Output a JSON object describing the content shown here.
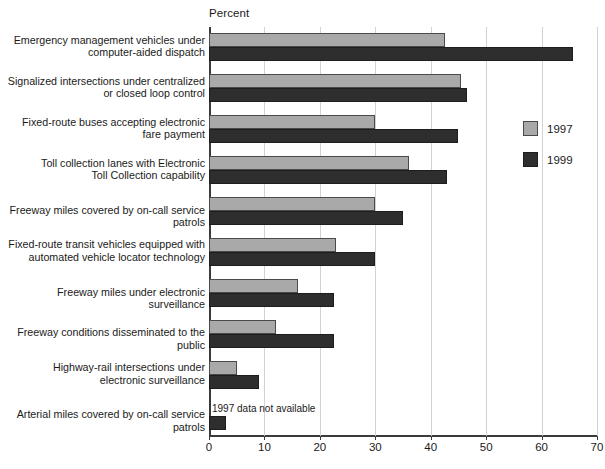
{
  "chart_data": {
    "type": "bar",
    "orientation": "horizontal",
    "title": "",
    "xlabel": "Percent",
    "ylabel": "",
    "xlim": [
      0,
      70
    ],
    "xticks": [
      0,
      10,
      20,
      30,
      40,
      50,
      60,
      70
    ],
    "grid": true,
    "legend_position": "right",
    "categories": [
      "Emergency management vehicles under\ncomputer-aided dispatch",
      "Signalized intersections under centralized\nor closed loop control",
      "Fixed-route buses accepting electronic\nfare payment",
      "Toll collection lanes with Electronic\nToll Collection capability",
      "Freeway miles covered by on-call service patrols",
      "Fixed-route transit vehicles equipped with\nautomated vehicle locator technology",
      "Freeway miles under electronic surveillance",
      "Freeway conditions disseminated to the public",
      "Highway-rail intersections under\nelectronic surveillance",
      "Arterial miles covered by on-call service patrols"
    ],
    "series": [
      {
        "name": "1997",
        "color": "#a9a9a9",
        "values": [
          42.5,
          45.5,
          30,
          36,
          30,
          23,
          16,
          12,
          5,
          null
        ]
      },
      {
        "name": "1999",
        "color": "#2e2e2e",
        "values": [
          65.7,
          46.5,
          45,
          43,
          35,
          30,
          22.5,
          22.5,
          9,
          3
        ]
      }
    ],
    "annotations": [
      {
        "text": "1997 data not available",
        "category_index": 9,
        "series": "1997"
      }
    ]
  },
  "legend": {
    "items": [
      {
        "label": "1997"
      },
      {
        "label": "1999"
      }
    ]
  }
}
